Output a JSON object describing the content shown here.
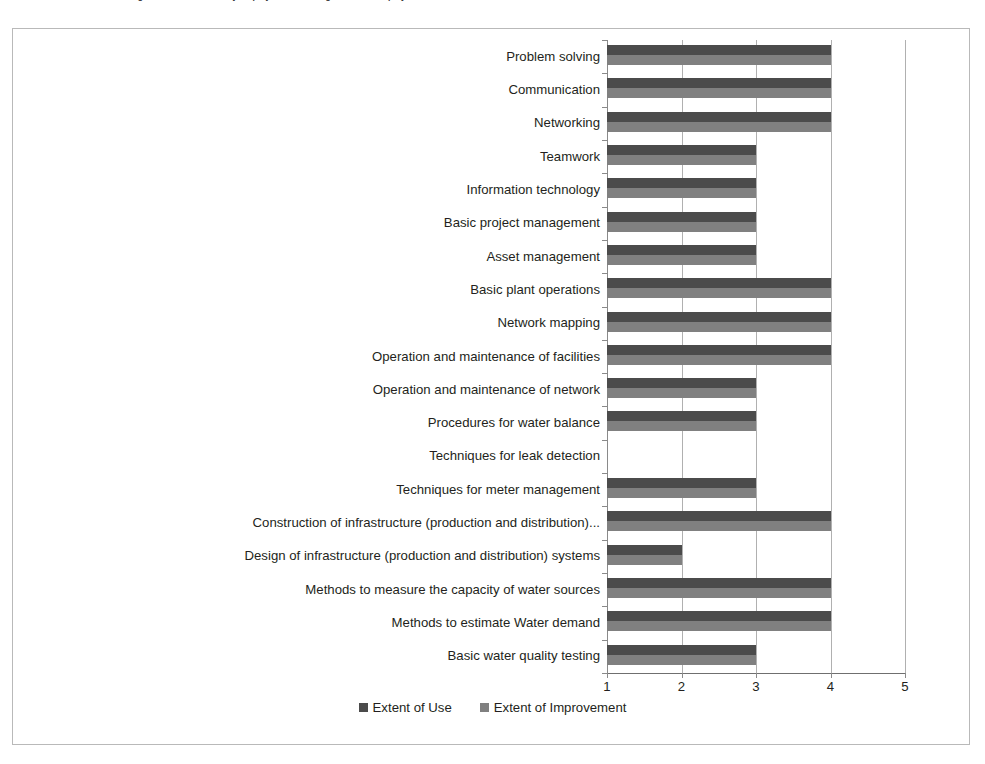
{
  "figure": {
    "caption": "Figure 3: Extent of Use by employees of existing skills and employees..."
  },
  "chart_data": {
    "type": "bar",
    "orientation": "horizontal",
    "title": "",
    "xlabel": "",
    "ylabel": "",
    "xlim": [
      1,
      5
    ],
    "xticks": [
      "1",
      "2",
      "3",
      "4",
      "5"
    ],
    "grid": true,
    "legend_position": "bottom",
    "categories": [
      "Problem solving",
      "Communication",
      "Networking",
      "Teamwork",
      "Information technology",
      "Basic project management",
      "Asset management",
      "Basic plant operations",
      "Network mapping",
      "Operation and maintenance of facilities",
      "Operation and maintenance of network",
      "Procedures for water balance",
      "Techniques  for leak detection",
      "Techniques for meter management",
      "Construction of infrastructure (production and distribution)...",
      "Design of infrastructure (production and distribution) systems",
      "Methods to measure the capacity of water sources",
      "Methods to estimate Water demand",
      "Basic water quality testing"
    ],
    "series": [
      {
        "name": "Extent of Use",
        "color": "#4b4b4b",
        "values": [
          4,
          4,
          4,
          3,
          3,
          3,
          3,
          4,
          4,
          4,
          3,
          3,
          1,
          3,
          4,
          2,
          4,
          4,
          3
        ]
      },
      {
        "name": "Extent of Improvement",
        "color": "#808080",
        "values": [
          4,
          4,
          4,
          3,
          3,
          3,
          3,
          4,
          4,
          4,
          3,
          3,
          1,
          3,
          4,
          2,
          4,
          4,
          3
        ]
      }
    ]
  }
}
